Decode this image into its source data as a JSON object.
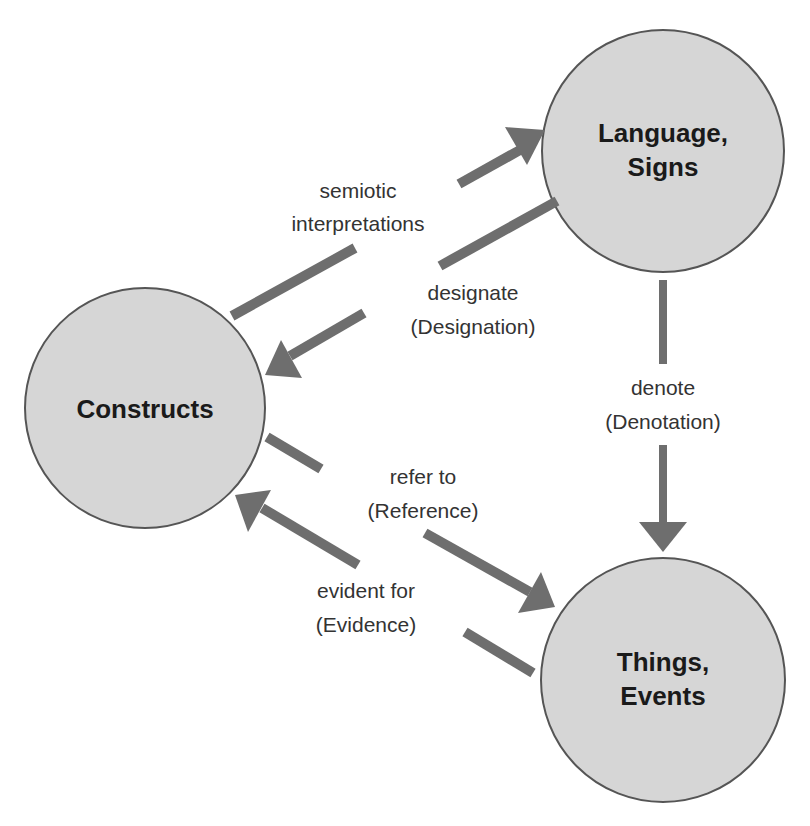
{
  "diagram": {
    "colors": {
      "node_fill": "#d6d6d6",
      "node_stroke": "#555555",
      "arrow": "#6e6e6e",
      "text": "#1a1a1a",
      "edge_text": "#333333"
    },
    "nodes": [
      {
        "id": "language",
        "lines": [
          "Language,",
          "Signs"
        ]
      },
      {
        "id": "constructs",
        "lines": [
          "Constructs"
        ]
      },
      {
        "id": "things",
        "lines": [
          "Things,",
          "Events"
        ]
      }
    ],
    "edges": [
      {
        "from": "constructs",
        "to": "language",
        "lines": [
          "semiotic",
          "interpretations"
        ]
      },
      {
        "from": "language",
        "to": "constructs",
        "lines": [
          "designate",
          "(Designation)"
        ]
      },
      {
        "from": "language",
        "to": "things",
        "lines": [
          "denote",
          "(Denotation)"
        ]
      },
      {
        "from": "constructs",
        "to": "things",
        "lines": [
          "refer to",
          "(Reference)"
        ]
      },
      {
        "from": "things",
        "to": "constructs",
        "lines": [
          "evident for",
          "(Evidence)"
        ]
      }
    ]
  }
}
